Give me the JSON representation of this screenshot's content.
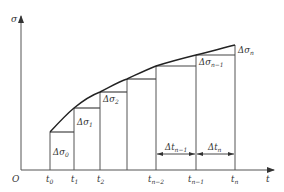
{
  "diagram": {
    "type": "stepwise-approximation",
    "axes": {
      "y_label": "σ",
      "x_label": "t",
      "origin_label": "O"
    },
    "x_ticks": [
      {
        "base": "t",
        "sub": "0"
      },
      {
        "base": "t",
        "sub": "1"
      },
      {
        "base": "t",
        "sub": "2"
      },
      {
        "base": "t",
        "sub": "n−2"
      },
      {
        "base": "t",
        "sub": "n−1"
      },
      {
        "base": "t",
        "sub": "n"
      }
    ],
    "increment_labels": [
      {
        "base": "Δσ",
        "sub": "0"
      },
      {
        "base": "Δσ",
        "sub": "1"
      },
      {
        "base": "Δσ",
        "sub": "2"
      },
      {
        "base": "Δσ",
        "sub": "n−1"
      },
      {
        "base": "Δσ",
        "sub": "n"
      }
    ],
    "interval_labels": [
      {
        "base": "Δt",
        "sub": "n−1"
      },
      {
        "base": "Δt",
        "sub": "n"
      }
    ],
    "colors": {
      "line": "#333333",
      "curve": "#222222",
      "text": "#333333"
    }
  }
}
